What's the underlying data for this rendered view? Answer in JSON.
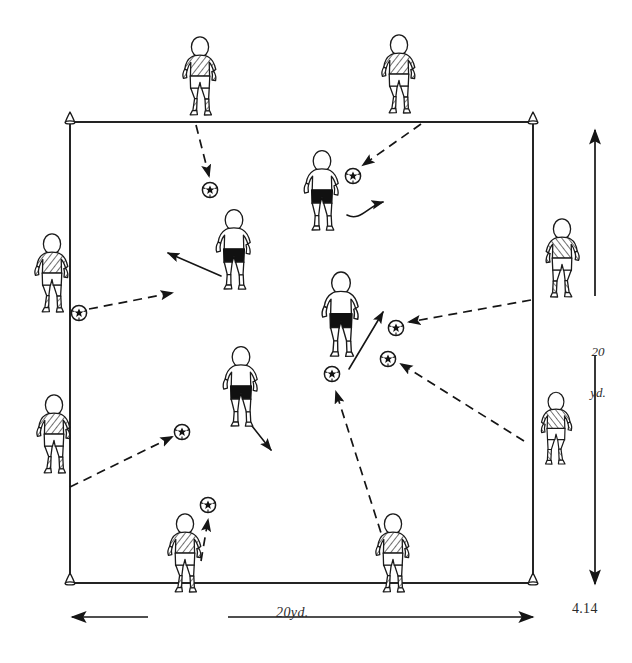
{
  "figure": {
    "number": "4.14",
    "type": "soccer-training-diagram",
    "title_not_shown": "",
    "grid": {
      "width_label": "20yd.",
      "height_label_line1": "20",
      "height_label_line2": "yd.",
      "shape": "square",
      "corner_markers": "cone",
      "corner_count": 4
    },
    "colors": {
      "ink": "#1a1a1a",
      "paper": "#ffffff",
      "dark_fill": "#111111",
      "label_ink": "#2b2b2b"
    },
    "legend_semantics": {
      "dashed_arrow": "pass / ball travel path",
      "solid_arrow": "player run / movement",
      "cone": "grid corner marker",
      "striped_player": "outside server (perimeter player)",
      "dark_shorts_player": "inside working player"
    },
    "pitch": {
      "x": 70,
      "y": 122,
      "w": 463,
      "h": 461
    },
    "cones": [
      {
        "name": "cone-top-left",
        "x": 70,
        "y": 122
      },
      {
        "name": "cone-top-right",
        "x": 533,
        "y": 122
      },
      {
        "name": "cone-bottom-left",
        "x": 70,
        "y": 583
      },
      {
        "name": "cone-bottom-right",
        "x": 533,
        "y": 583
      }
    ],
    "players": [
      {
        "id": "p1",
        "name": "player-outside-top-left",
        "kit": "striped",
        "x": 200,
        "y": 80,
        "scale": 1.0,
        "flip": false
      },
      {
        "id": "p2",
        "name": "player-outside-top-right",
        "kit": "striped",
        "x": 399,
        "y": 78,
        "scale": 1.0,
        "flip": false
      },
      {
        "id": "p3",
        "name": "player-outside-left-upper",
        "kit": "striped",
        "x": 52,
        "y": 277,
        "scale": 0.95,
        "flip": false
      },
      {
        "id": "p4",
        "name": "player-outside-left-lower",
        "kit": "striped",
        "x": 54,
        "y": 438,
        "scale": 0.95,
        "flip": false
      },
      {
        "id": "p5",
        "name": "player-outside-right-upper",
        "kit": "striped",
        "x": 562,
        "y": 262,
        "scale": 0.95,
        "flip": true
      },
      {
        "id": "p6",
        "name": "player-outside-right-lower",
        "kit": "striped",
        "x": 556,
        "y": 432,
        "scale": 0.88,
        "flip": true
      },
      {
        "id": "p7",
        "name": "player-outside-bottom-left",
        "kit": "striped",
        "x": 185,
        "y": 557,
        "scale": 1.0,
        "flip": false
      },
      {
        "id": "p8",
        "name": "player-outside-bottom-right",
        "kit": "striped",
        "x": 393,
        "y": 557,
        "scale": 1.0,
        "flip": false
      },
      {
        "id": "p9",
        "name": "player-inside-upper-left",
        "kit": "dark-shorts",
        "x": 234,
        "y": 253,
        "scale": 1.0,
        "flip": false
      },
      {
        "id": "p10",
        "name": "player-inside-upper-right",
        "kit": "dark-shorts",
        "x": 322,
        "y": 194,
        "scale": 1.0,
        "flip": false
      },
      {
        "id": "p11",
        "name": "player-inside-center",
        "kit": "dark-shorts",
        "x": 341,
        "y": 320,
        "scale": 1.05,
        "flip": false
      },
      {
        "id": "p12",
        "name": "player-inside-lower-left",
        "kit": "dark-shorts",
        "x": 241,
        "y": 390,
        "scale": 1.0,
        "flip": false
      }
    ],
    "balls": [
      {
        "id": "b1",
        "name": "ball-upper-left",
        "x": 210,
        "y": 190
      },
      {
        "id": "b2",
        "name": "ball-upper-right",
        "x": 353,
        "y": 176
      },
      {
        "id": "b3",
        "name": "ball-left-edge",
        "x": 79,
        "y": 313
      },
      {
        "id": "b4",
        "name": "ball-right-upper",
        "x": 396,
        "y": 328
      },
      {
        "id": "b5",
        "name": "ball-right-lower",
        "x": 388,
        "y": 359
      },
      {
        "id": "b6",
        "name": "ball-center-low",
        "x": 332,
        "y": 374
      },
      {
        "id": "b7",
        "name": "ball-left-mid",
        "x": 182,
        "y": 432
      },
      {
        "id": "b8",
        "name": "ball-bottom-center",
        "x": 208,
        "y": 505
      }
    ],
    "pass_arrows": [
      {
        "name": "pass-top-left-to-ball1",
        "x1": 196,
        "y1": 125,
        "x2": 209,
        "y2": 176
      },
      {
        "name": "pass-top-right-to-ball2",
        "x1": 420,
        "y1": 124,
        "x2": 363,
        "y2": 164
      },
      {
        "name": "pass-left-edge-to-inside",
        "x1": 88,
        "y1": 309,
        "x2": 173,
        "y2": 293
      },
      {
        "name": "pass-right-upper-to-ball4",
        "x1": 530,
        "y1": 300,
        "x2": 408,
        "y2": 322
      },
      {
        "name": "pass-right-lower-to-ball5",
        "x1": 524,
        "y1": 442,
        "x2": 400,
        "y2": 363
      },
      {
        "name": "pass-left-lower-to-ball7",
        "x1": 70,
        "y1": 487,
        "x2": 172,
        "y2": 437
      },
      {
        "name": "pass-bottom-left-to-ball8",
        "x1": 200,
        "y1": 560,
        "x2": 208,
        "y2": 519
      },
      {
        "name": "pass-bottom-right-to-ball6",
        "x1": 389,
        "y1": 560,
        "x2": 334,
        "y2": 390
      }
    ],
    "run_arrows": [
      {
        "name": "run-inside-upper-left",
        "x1": 219,
        "y1": 275,
        "x2": 165,
        "y2": 252
      },
      {
        "name": "run-inside-upper-right-curve",
        "x1": 348,
        "y1": 213,
        "x2": 384,
        "y2": 201
      },
      {
        "name": "run-inside-center-up-right",
        "x1": 349,
        "y1": 368,
        "x2": 384,
        "y2": 310
      },
      {
        "name": "run-inside-lower-left-down",
        "x1": 252,
        "y1": 425,
        "x2": 272,
        "y2": 451
      }
    ],
    "dimension_arrows": [
      {
        "name": "dimension-arrow-horizontal",
        "x1": 70,
        "y1": 617,
        "x2": 535,
        "y2": 617
      },
      {
        "name": "dimension-arrow-vertical",
        "x1": 595,
        "y1": 130,
        "x2": 595,
        "y2": 585
      }
    ]
  }
}
